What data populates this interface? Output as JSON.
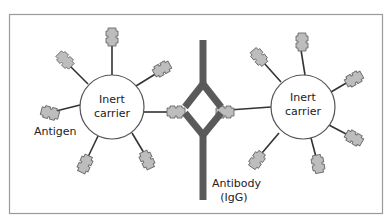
{
  "diagram": {
    "labels": {
      "left_carrier_line1": "Inert",
      "left_carrier_line2": "carrier",
      "right_carrier_line1": "Inert",
      "right_carrier_line2": "carrier",
      "antigen": "Antigen",
      "antibody_line1": "Antibody",
      "antibody_line2": "(IgG)"
    },
    "colors": {
      "border": "#9a9a9a",
      "antibody": "#5a5a5a",
      "antigen_fill": "#bdbdbd",
      "antigen_stroke": "#6a6a6a",
      "stalk": "#333333",
      "carrier_stroke": "#555555"
    }
  }
}
